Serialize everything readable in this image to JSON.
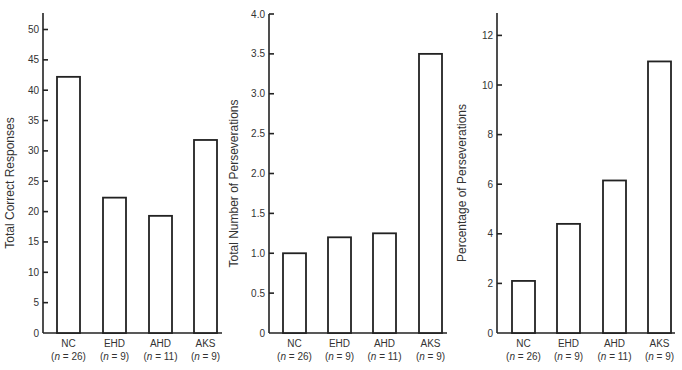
{
  "chart_data": [
    {
      "type": "bar",
      "title": "",
      "xlabel": "",
      "ylabel": "Total Correct Responses",
      "categories": [
        "NC",
        "EHD",
        "AHD",
        "AKS"
      ],
      "category_n": [
        "(n = 26)",
        "(n = 9)",
        "(n = 11)",
        "(n = 9)"
      ],
      "values": [
        42.2,
        22.3,
        19.3,
        31.8
      ],
      "ylim": [
        0,
        53
      ],
      "yticks": [
        0,
        5,
        10,
        15,
        20,
        25,
        30,
        35,
        40,
        45,
        50
      ],
      "ytick_labels": [
        "0",
        "5",
        "10",
        "15",
        "20",
        "25",
        "30",
        "35",
        "40",
        "45",
        "50"
      ],
      "grid": false,
      "legend": null
    },
    {
      "type": "bar",
      "title": "",
      "xlabel": "",
      "ylabel": "Total Number of Perseverations",
      "categories": [
        "NC",
        "EHD",
        "AHD",
        "AKS"
      ],
      "category_n": [
        "(n = 26)",
        "(n = 9)",
        "(n = 11)",
        "(n = 9)"
      ],
      "values": [
        1.0,
        1.2,
        1.25,
        3.5
      ],
      "ylim": [
        0,
        4.0
      ],
      "yticks": [
        0,
        0.5,
        1.0,
        1.5,
        2.0,
        2.5,
        3.0,
        3.5,
        4.0
      ],
      "ytick_labels": [
        "0",
        "0.5",
        "1.0",
        "1.5",
        "2.0",
        "2.5",
        "3.0",
        "3.5",
        "4.0"
      ],
      "grid": false,
      "legend": null
    },
    {
      "type": "bar",
      "title": "",
      "xlabel": "",
      "ylabel": "Percentage of Perseverations",
      "categories": [
        "NC",
        "EHD",
        "AHD",
        "AKS"
      ],
      "category_n": [
        "(n = 26)",
        "(n = 9)",
        "(n = 11)",
        "(n = 9)"
      ],
      "values": [
        2.1,
        4.4,
        6.15,
        10.95
      ],
      "ylim": [
        0,
        12.8
      ],
      "yticks": [
        0,
        2,
        4,
        6,
        8,
        10,
        12
      ],
      "ytick_labels": [
        "0",
        "2",
        "4",
        "6",
        "8",
        "10",
        "12"
      ],
      "grid": false,
      "legend": null
    }
  ],
  "layout": {
    "baseline_y": 333,
    "panels": [
      {
        "axis_x": 43,
        "axis_top": 13,
        "axis_right": 222,
        "px_per_unit": 6.07,
        "bar_x": [
          57,
          103,
          149,
          194
        ],
        "ylabel_x": 14
      },
      {
        "axis_x": 269,
        "axis_top": 14,
        "axis_right": 447,
        "px_per_unit": 79.75,
        "bar_x": [
          283,
          328,
          373,
          419
        ],
        "ylabel_x": 238
      },
      {
        "axis_x": 497,
        "axis_top": 13,
        "axis_right": 675,
        "px_per_unit": 24.8,
        "bar_x": [
          512,
          557,
          603,
          648
        ],
        "ylabel_x": 466
      }
    ],
    "bar_width": 23
  }
}
